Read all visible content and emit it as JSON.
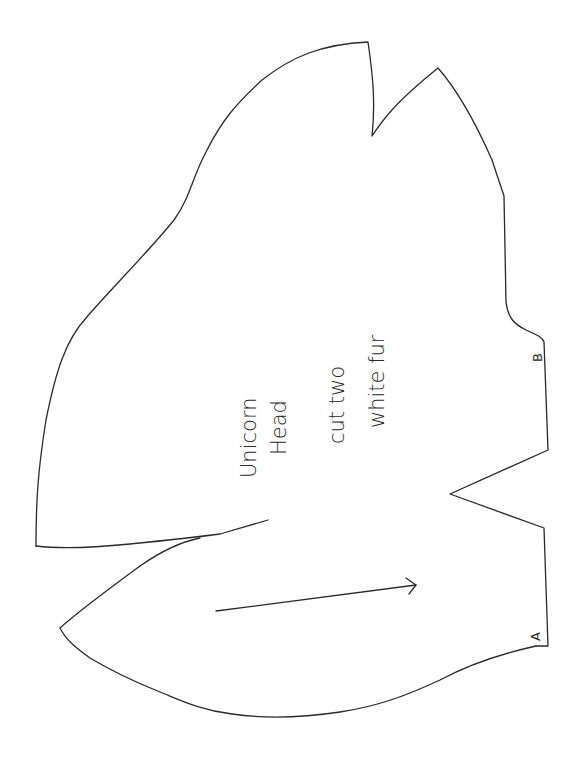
{
  "pattern": {
    "piece_name": "Unicorn",
    "piece_part": "Head",
    "instruction_quantity": "cut two",
    "instruction_material": "white fur",
    "markers": {
      "a": "A",
      "b": "B"
    },
    "line_color": "#2a2a2a",
    "background_color": "#ffffff",
    "orientation": "rotated -90deg"
  }
}
